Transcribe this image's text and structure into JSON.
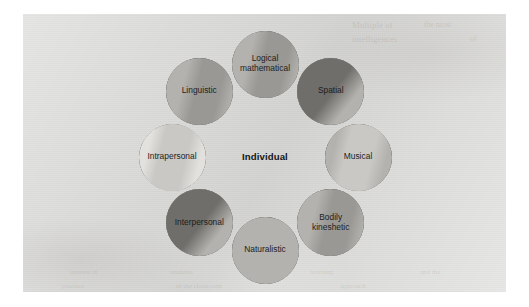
{
  "figure": {
    "type": "venn-ring-diagram",
    "center_label": "Individual",
    "nodes": [
      {
        "id": "logical-mathematical",
        "label": "Logical\nmathematical",
        "angle_deg": 270,
        "fill": "#b3b2ae",
        "shade": "medium",
        "pale": false
      },
      {
        "id": "spatial",
        "label": "Spatial",
        "angle_deg": 315,
        "fill": "#b3b2ae",
        "shade": "dark",
        "pale": false
      },
      {
        "id": "musical",
        "label": "Musical",
        "angle_deg": 0,
        "fill": "#b3b2ae",
        "shade": "light",
        "pale": false
      },
      {
        "id": "bodily-kineshetic",
        "label": "Bodily\nkineshetic",
        "angle_deg": 45,
        "fill": "#b3b2ae",
        "shade": "medium",
        "pale": false
      },
      {
        "id": "naturalistic",
        "label": "Naturalistic",
        "angle_deg": 90,
        "fill": "#b3b2ae",
        "shade": "none",
        "pale": false
      },
      {
        "id": "interpersonal",
        "label": "Interpersonal",
        "angle_deg": 135,
        "fill": "#b3b2ae",
        "shade": "dark",
        "pale": false
      },
      {
        "id": "intrapersonal",
        "label": "Intrapersonal",
        "angle_deg": 180,
        "fill": "#e2e1dd",
        "shade": "light",
        "pale": true
      },
      {
        "id": "linguistic",
        "label": "Linguistic",
        "angle_deg": 225,
        "fill": "#b3b2ae",
        "shade": "medium",
        "pale": false
      }
    ],
    "geometry": {
      "ring_center_x": 265,
      "ring_center_y": 157,
      "ring_radius": 93,
      "node_diameter": 67
    },
    "colors": {
      "page": "#dcdcda",
      "circle_fill": "#b3b2ae",
      "circle_fill_pale": "#e2e1dd",
      "overlap_dark": "#6f6e6a",
      "overlap_light": "#c9c8c4",
      "stroke": "#2b2b2b",
      "text": "#1d1d1d",
      "margin": "#ffffff"
    }
  },
  "background_showthrough": [
    {
      "text": "Multiple of",
      "x": 352,
      "y": 20,
      "size": 9,
      "rotate": 0
    },
    {
      "text": "intelligences",
      "x": 352,
      "y": 34,
      "size": 9,
      "rotate": 0
    },
    {
      "text": "the most",
      "x": 424,
      "y": 20,
      "size": 8,
      "rotate": 0
    },
    {
      "text": "of",
      "x": 470,
      "y": 34,
      "size": 8,
      "rotate": 0
    },
    {
      "text": "interest in",
      "x": 70,
      "y": 268,
      "size": 7,
      "rotate": 0
    },
    {
      "text": "students",
      "x": 170,
      "y": 268,
      "size": 7,
      "rotate": 0
    },
    {
      "text": "learning",
      "x": 310,
      "y": 268,
      "size": 7,
      "rotate": 0
    },
    {
      "text": "and the",
      "x": 420,
      "y": 268,
      "size": 7,
      "rotate": 0
    },
    {
      "text": "practice",
      "x": 62,
      "y": 282,
      "size": 7,
      "rotate": 0
    },
    {
      "text": "in the classroom",
      "x": 176,
      "y": 282,
      "size": 7,
      "rotate": 0
    },
    {
      "text": "approach",
      "x": 340,
      "y": 282,
      "size": 7,
      "rotate": 0
    }
  ]
}
